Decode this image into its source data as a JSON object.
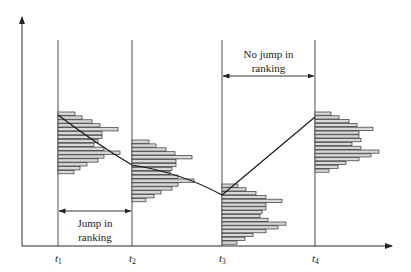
{
  "diagram": {
    "title": "",
    "axes": {
      "x_arrow": true,
      "y_arrow": true
    },
    "time_points": [
      {
        "label": "t",
        "sub": "1",
        "x": 58
      },
      {
        "label": "t",
        "sub": "2",
        "x": 132
      },
      {
        "label": "t",
        "sub": "3",
        "x": 222
      },
      {
        "label": "t",
        "sub": "4",
        "x": 315
      }
    ],
    "annotations": [
      {
        "id": "jump",
        "line1": "Jump in",
        "line2": "ranking",
        "from": 0,
        "to": 1,
        "arrow_y": 211,
        "text_y1": 227,
        "text_y2": 241
      },
      {
        "id": "no-jump",
        "line1": "No jump in",
        "line2": "ranking",
        "from": 2,
        "to": 3,
        "arrow_y": 76,
        "text_y1": 58,
        "text_y2": 72
      }
    ],
    "histograms": [
      {
        "at": 0,
        "top": 112,
        "bar_h": 3.9,
        "widths": [
          17,
          24,
          34,
          42,
          60,
          44,
          44,
          40,
          36,
          46,
          62,
          46,
          40,
          29,
          22,
          16
        ]
      },
      {
        "at": 1,
        "top": 140,
        "bar_h": 3.9,
        "widths": [
          17,
          24,
          34,
          43,
          60,
          44,
          44,
          40,
          38,
          46,
          62,
          46,
          40,
          29,
          22,
          14
        ]
      },
      {
        "at": 2,
        "top": 184,
        "bar_h": 3.8,
        "widths": [
          16,
          24,
          34,
          44,
          60,
          44,
          44,
          40,
          38,
          46,
          64,
          56,
          44,
          31,
          23,
          15
        ]
      },
      {
        "at": 3,
        "top": 112,
        "bar_h": 3.8,
        "widths": [
          16,
          24,
          34,
          42,
          58,
          44,
          44,
          46,
          37,
          46,
          64,
          56,
          44,
          31,
          23,
          14
        ]
      }
    ],
    "trajectory": [
      [
        58,
        115
      ],
      [
        132,
        165
      ],
      [
        222,
        195
      ],
      [
        315,
        117
      ]
    ],
    "colors": {
      "bar_fill": "#d8d8d8",
      "stroke": "#222222",
      "background": "#ffffff"
    }
  }
}
